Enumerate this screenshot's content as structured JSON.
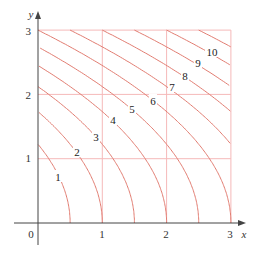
{
  "chart_data": {
    "type": "line",
    "title": "",
    "xlabel": "x",
    "ylabel": "y",
    "xlim": [
      0,
      3
    ],
    "ylim": [
      0,
      3
    ],
    "grid": true,
    "x_ticks": [
      "0",
      "1",
      "2",
      "3"
    ],
    "y_ticks": [
      "1",
      "2",
      "3"
    ],
    "origin_label": "0",
    "levels": [
      1,
      2,
      3,
      4,
      5,
      6,
      7,
      8,
      9,
      10,
      11
    ],
    "level_labels": [
      {
        "text": "1",
        "x": 58,
        "y": 177
      },
      {
        "text": "2",
        "x": 77,
        "y": 152
      },
      {
        "text": "3",
        "x": 96,
        "y": 137
      },
      {
        "text": "4",
        "x": 113,
        "y": 120
      },
      {
        "text": "5",
        "x": 132,
        "y": 109
      },
      {
        "text": "6",
        "x": 153,
        "y": 101
      },
      {
        "text": "7",
        "x": 172,
        "y": 87
      },
      {
        "text": "8",
        "x": 185,
        "y": 76
      },
      {
        "text": "9",
        "x": 198,
        "y": 63
      },
      {
        "text": "10",
        "x": 212,
        "y": 52
      }
    ],
    "series": [
      {
        "name": "k=1",
        "x_at_y0": 0.5,
        "y_at_x0": 1.22
      },
      {
        "name": "k=2",
        "x_at_y0": 1.0,
        "y_at_x0": 1.73
      },
      {
        "name": "k=3",
        "x_at_y0": 1.5,
        "y_at_x0": 2.12
      },
      {
        "name": "k=4",
        "x_at_y0": 2.0,
        "y_at_x0": 2.45
      },
      {
        "name": "k=5",
        "x_at_y0": 2.5,
        "y_at_x0": 2.74
      },
      {
        "name": "k=6",
        "x_at_y0": 3.0,
        "y_at_x0": 3.0
      },
      {
        "name": "k=7",
        "x_at_y3": 0.5,
        "y_at_x3": 1.22
      },
      {
        "name": "k=8",
        "x_at_y3": 1.0,
        "y_at_x3": 1.73
      },
      {
        "name": "k=9",
        "x_at_y3": 1.5,
        "y_at_x3": 2.12
      },
      {
        "name": "k=10",
        "x_at_y3": 2.0,
        "y_at_x3": 2.45
      },
      {
        "name": "k=11",
        "x_at_y3": 2.5,
        "y_at_x3": 2.74
      }
    ],
    "colors": {
      "curve": "#e27d72",
      "grid": "#f5b9b9",
      "axis": "#444444"
    }
  }
}
